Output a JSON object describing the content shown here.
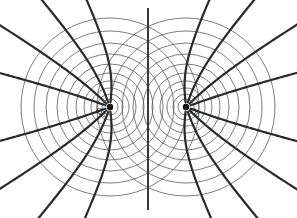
{
  "figure": {
    "type": "physics-field-diagram",
    "background_color": "#ffffff",
    "width": 297,
    "height": 218
  },
  "colors": {
    "equipotential_stroke": "#5a5a5a",
    "fieldline_stroke": "#2b2b2b",
    "axis_stroke": "#3a3a3a",
    "charge_fill": "#111111"
  },
  "charges": [
    {
      "id": "Q1",
      "label_base": "Q",
      "label_sub": "1",
      "cx": 110,
      "cy": 107,
      "r_dot": 3.2,
      "label_x": 96,
      "label_y": 114
    },
    {
      "id": "Q2",
      "label_base": "Q",
      "label_sub": "2",
      "cx": 186,
      "cy": 107,
      "r_dot": 3.2,
      "label_x": 190,
      "label_y": 114
    }
  ],
  "equipotential_radii": [
    8,
    13,
    19,
    26,
    34,
    43,
    53,
    64,
    76,
    89
  ],
  "axis_line": {
    "x": 148,
    "y1": 8,
    "y2": 210
  },
  "chart_data": {
    "type": "scatter",
    "xlabel": "",
    "ylabel": "",
    "xlim": [
      0,
      297
    ],
    "ylim": [
      0,
      218
    ],
    "grid": false,
    "legend": null,
    "series": [
      {
        "name": "Point charges",
        "x": [
          110,
          186
        ],
        "y": [
          107,
          107
        ],
        "labels": [
          "Q1",
          "Q2"
        ]
      }
    ],
    "annotations": [
      {
        "text": "Q1",
        "x": 110,
        "y": 107
      },
      {
        "text": "Q2",
        "x": 186,
        "y": 107
      }
    ],
    "equipotential_circle_count_per_charge": 10,
    "field_line_count": 15
  }
}
